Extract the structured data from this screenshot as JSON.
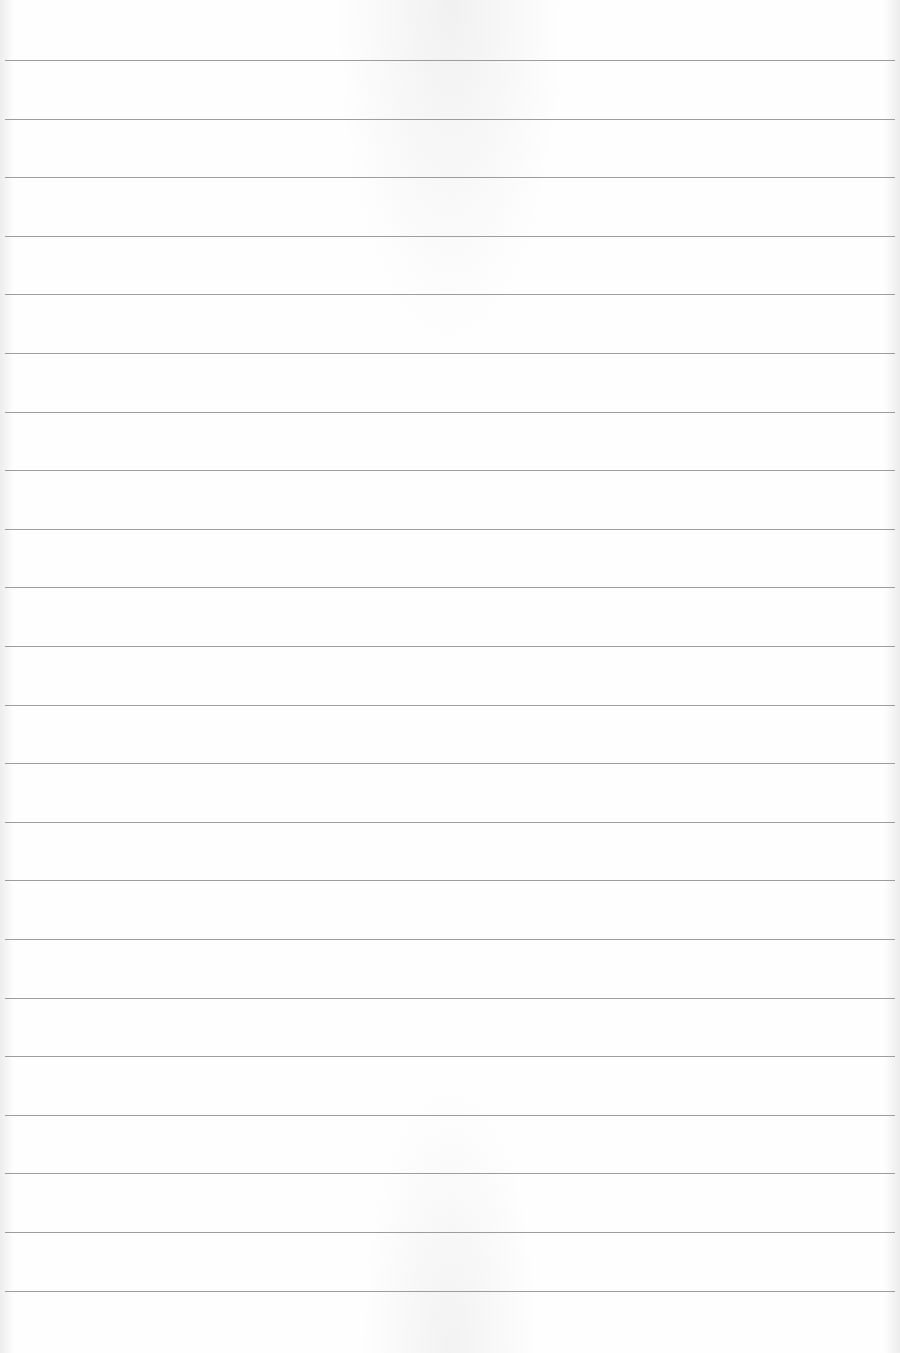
{
  "page": {
    "type": "ruled-paper",
    "background_color": "#fefefe",
    "line_color": "#8c8c8c",
    "line_count": 22,
    "first_line_y": 60,
    "line_spacing_px": 58.6,
    "line_left_x": 5,
    "line_right_x": 895,
    "text": ""
  }
}
